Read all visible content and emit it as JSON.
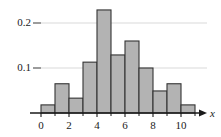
{
  "chart_data": {
    "type": "bar",
    "title": "",
    "subtitle": "",
    "xlabel": "x",
    "ylabel": "",
    "categories": [
      "0-1",
      "1-2",
      "2-3",
      "3-4",
      "4-5",
      "5-6",
      "6-7",
      "7-8",
      "8-9",
      "9-10",
      "10-11"
    ],
    "bin_edges": [
      0,
      1,
      2,
      3,
      4,
      5,
      6,
      7,
      8,
      9,
      10,
      11
    ],
    "values": [
      0.018,
      0.065,
      0.033,
      0.113,
      0.229,
      0.129,
      0.16,
      0.1,
      0.049,
      0.065,
      0.018
    ],
    "xlim": [
      -0.6,
      11.6
    ],
    "ylim": [
      0,
      0.245
    ],
    "x_ticks": [
      0,
      2,
      4,
      6,
      8,
      10
    ],
    "x_tick_labels": [
      "0",
      "2",
      "4",
      "6",
      "8",
      "10"
    ],
    "x_minor_ticks": [
      1,
      3,
      5,
      7,
      9,
      11
    ],
    "y_ticks": [
      0.1,
      0.2
    ],
    "y_tick_labels": [
      "0.1",
      "0.2"
    ],
    "grid": "horizontal-only",
    "legend": "none",
    "bar_fill_color": "#b3b3b3",
    "bar_edge_color": "#333333",
    "axis_color": "#1a1a1a",
    "grid_color": "#d9d9d9",
    "x_axis_arrow": true,
    "annotations": []
  },
  "axis_labels": {
    "x_axis_name": "x"
  }
}
